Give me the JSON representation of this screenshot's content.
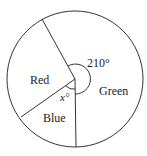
{
  "diagram": {
    "type": "pie",
    "sectors": [
      {
        "name": "Red",
        "label": "Red"
      },
      {
        "name": "Blue",
        "label": "Blue"
      },
      {
        "name": "Green",
        "label": "Green"
      }
    ],
    "angles": {
      "green_label": "210°",
      "blue_label": "x°",
      "green_degrees": 210,
      "blue_degrees": "x"
    }
  },
  "colors": {
    "stroke": "#333333",
    "background": "#ffffff"
  }
}
